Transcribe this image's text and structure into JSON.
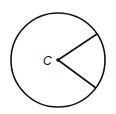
{
  "diagram": {
    "type": "circle-sector",
    "center_label": "C",
    "center": [
      58,
      60
    ],
    "radius": 47,
    "radii_endpoints": [
      [
        97,
        34
      ],
      [
        96,
        88
      ]
    ],
    "stroke_color": "#111111",
    "background": "#ffffff"
  }
}
